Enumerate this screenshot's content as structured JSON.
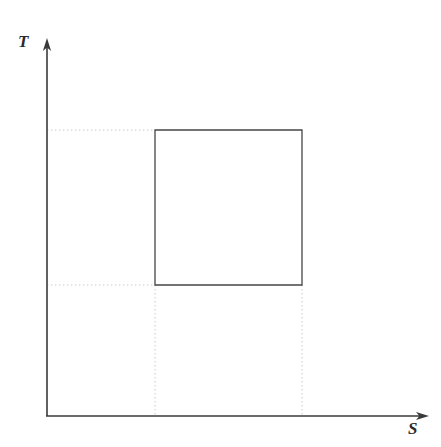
{
  "figure": {
    "background_color": "#ffffff",
    "width": 441,
    "height": 447
  },
  "axes": {
    "vertical": {
      "label": "T",
      "name": "temperature-axis",
      "color": "#3a3a3a",
      "origin": {
        "x": 47,
        "y": 416
      },
      "tip": {
        "x": 47,
        "y": 38
      },
      "arrowhead": true
    },
    "horizontal": {
      "label": "S",
      "name": "entropy-axis",
      "color": "#3a3a3a",
      "origin": {
        "x": 47,
        "y": 416
      },
      "tip": {
        "x": 429,
        "y": 416
      },
      "arrowhead": true
    }
  },
  "chart_data": {
    "type": "line",
    "title": "",
    "xlabel": "S",
    "ylabel": "T",
    "grid": false,
    "legend": null,
    "series": [
      {
        "name": "rectangular-cycle",
        "closed": true,
        "stroke": "#454545",
        "points": [
          {
            "x": 155,
            "y": 130
          },
          {
            "x": 302,
            "y": 130
          },
          {
            "x": 302,
            "y": 285
          },
          {
            "x": 155,
            "y": 285
          }
        ]
      }
    ],
    "guides": [
      {
        "name": "guide-top-horizontal",
        "orientation": "horizontal",
        "from": {
          "x": 47,
          "y": 130
        },
        "to": {
          "x": 155,
          "y": 130
        },
        "style": "dotted"
      },
      {
        "name": "guide-bottom-horizontal",
        "orientation": "horizontal",
        "from": {
          "x": 47,
          "y": 285
        },
        "to": {
          "x": 155,
          "y": 285
        },
        "style": "dotted"
      },
      {
        "name": "guide-left-vertical",
        "orientation": "vertical",
        "from": {
          "x": 155,
          "y": 285
        },
        "to": {
          "x": 155,
          "y": 416
        },
        "style": "dotted"
      },
      {
        "name": "guide-right-vertical",
        "orientation": "vertical",
        "from": {
          "x": 302,
          "y": 285
        },
        "to": {
          "x": 302,
          "y": 416
        },
        "style": "dotted"
      }
    ],
    "guide_color": "#c9c9c9"
  }
}
